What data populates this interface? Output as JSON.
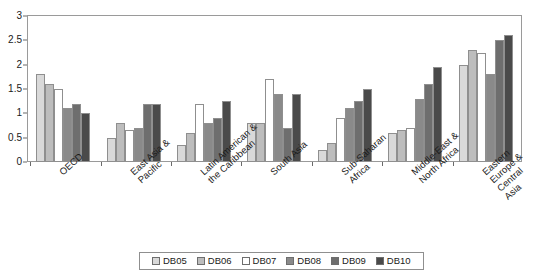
{
  "chart_data": {
    "type": "bar",
    "title": "",
    "subtitle": "",
    "xlabel": "",
    "ylabel": "",
    "ylim": [
      0,
      3
    ],
    "yticks": [
      0,
      0.5,
      1,
      1.5,
      2,
      2.5,
      3
    ],
    "ytick_labels": [
      "0",
      "0.5",
      "1",
      "1.5",
      "2",
      "2.5",
      "3"
    ],
    "grid": false,
    "legend_position": "bottom",
    "categories": [
      "OECD",
      "East Asia &\nPacific",
      "Latin American &\nthe Caribbean",
      "South Asia",
      "Sub-Saharan\nAfrica",
      "Middle-East &\nNorth Africa",
      "Eastern Europe &\nCentral Asia"
    ],
    "series": [
      {
        "name": "DB05",
        "color": "#d9d9d9",
        "values": [
          1.8,
          0.5,
          0.35,
          0.8,
          0.25,
          0.6,
          2.0
        ]
      },
      {
        "name": "DB06",
        "color": "#bdbdbd",
        "values": [
          1.6,
          0.8,
          0.6,
          0.8,
          0.4,
          0.65,
          2.3
        ]
      },
      {
        "name": "DB07",
        "color": "#ffffff",
        "values": [
          1.5,
          0.65,
          1.2,
          1.7,
          0.9,
          0.7,
          2.25
        ]
      },
      {
        "name": "DB08",
        "color": "#8a8a8a",
        "values": [
          1.1,
          0.7,
          0.8,
          1.4,
          1.1,
          1.3,
          1.8
        ]
      },
      {
        "name": "DB09",
        "color": "#6e6e6e",
        "values": [
          1.2,
          1.2,
          0.9,
          0.7,
          1.25,
          1.6,
          2.5
        ]
      },
      {
        "name": "DB10",
        "color": "#4a4a4a",
        "values": [
          1.0,
          1.2,
          1.25,
          1.4,
          1.5,
          1.95,
          2.6
        ]
      }
    ]
  }
}
